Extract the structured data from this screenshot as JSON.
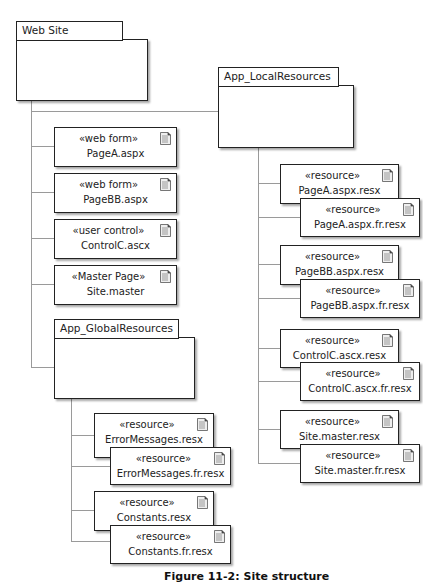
{
  "diagram": {
    "type": "UML package / component deployment diagram",
    "root_package": {
      "label": "Web Site"
    },
    "local_resources_package": {
      "label": "App_LocalResources"
    },
    "global_resources_package": {
      "label": "App_GlobalResources"
    },
    "site_items": [
      {
        "stereotype": "«web form»",
        "name": "PageA.aspx",
        "icon": "document-icon"
      },
      {
        "stereotype": "«web form»",
        "name": "PageBB.aspx",
        "icon": "document-icon"
      },
      {
        "stereotype": "«user control»",
        "name": "ControlC.ascx",
        "icon": "document-icon"
      },
      {
        "stereotype": "«Master Page»",
        "name": "Site.master",
        "icon": "document-icon"
      }
    ],
    "global_resources": [
      {
        "stereotype": "«resource»",
        "name": "ErrorMessages.resx",
        "icon": "document-icon"
      },
      {
        "stereotype": "«resource»",
        "name": "ErrorMessages.fr.resx",
        "icon": "document-icon"
      },
      {
        "stereotype": "«resource»",
        "name": "Constants.resx",
        "icon": "document-icon"
      },
      {
        "stereotype": "«resource»",
        "name": "Constants.fr.resx",
        "icon": "document-icon"
      }
    ],
    "local_resources": [
      {
        "stereotype": "«resource»",
        "name": "PageA.aspx.resx",
        "icon": "document-icon"
      },
      {
        "stereotype": "«resource»",
        "name": "PageA.aspx.fr.resx",
        "icon": "document-icon"
      },
      {
        "stereotype": "«resource»",
        "name": "PageBB.aspx.resx",
        "icon": "document-icon"
      },
      {
        "stereotype": "«resource»",
        "name": "PageBB.aspx.fr.resx",
        "icon": "document-icon"
      },
      {
        "stereotype": "«resource»",
        "name": "ControlC.ascx.resx",
        "icon": "document-icon"
      },
      {
        "stereotype": "«resource»",
        "name": "ControlC.ascx.fr.resx",
        "icon": "document-icon"
      },
      {
        "stereotype": "«resource»",
        "name": "Site.master.resx",
        "icon": "document-icon"
      },
      {
        "stereotype": "«resource»",
        "name": "Site.master.fr.resx",
        "icon": "document-icon"
      }
    ],
    "caption": "Figure 11-2: Site structure"
  }
}
